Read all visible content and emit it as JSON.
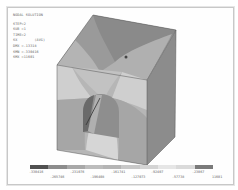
{
  "info": {
    "title": "NODAL SOLUTION",
    "step": "STEP=2",
    "sub": "SUB =1",
    "time": "TIME=2",
    "component": "SX        (AVG)",
    "dmx": "DMX =.13318",
    "smn": "SMN =-330416",
    "smx": "SMX =11601"
  },
  "legend": {
    "colors": [
      "#505050",
      "#8c8c8c",
      "#a8a8a8",
      "#bcbcbc",
      "#b4b4b4",
      "#c8c8c8",
      "#d4d4d4",
      "#e6e6e6",
      "#dadada",
      "#7a7a7a"
    ],
    "top_labels": [
      "-330416",
      "-231076",
      "-161741",
      "-92407",
      "-23067"
    ],
    "bottom_labels": [
      "-265746",
      "-196408",
      "-127073",
      "-57738",
      "11601"
    ]
  }
}
